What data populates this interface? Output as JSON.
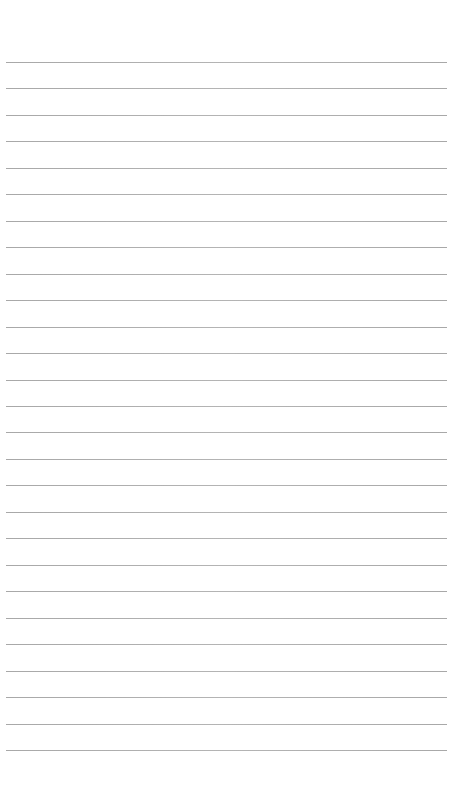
{
  "page": {
    "type": "lined-paper",
    "background_color": "#ffffff",
    "line_color": "#aeaeae",
    "line_count": 27,
    "first_line_y": 62,
    "line_spacing": 26.46,
    "line_left": 6,
    "line_right": 447
  }
}
